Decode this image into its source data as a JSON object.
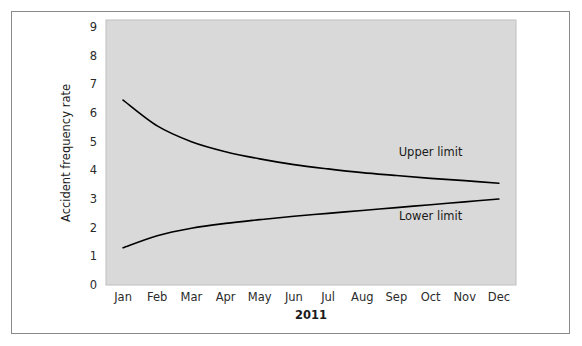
{
  "figure": {
    "width": 582,
    "height": 346,
    "background_color": "#ffffff",
    "border_color": "#8a8a8a",
    "plot_background_color": "#d9d9d9",
    "curve_color": "#000000"
  },
  "chart_data": {
    "type": "line",
    "title": "",
    "subtitle": "",
    "xlabel": "2011",
    "ylabel": "Accident frequency rate",
    "categories": [
      "Jan",
      "Feb",
      "Mar",
      "Apr",
      "May",
      "Jun",
      "Jul",
      "Aug",
      "Sep",
      "Oct",
      "Nov",
      "Dec"
    ],
    "xtick_labels": [
      "Jan",
      "Feb",
      "Mar",
      "Apr",
      "May",
      "Jun",
      "Jul",
      "Aug",
      "Sep",
      "Oct",
      "Nov",
      "Dec"
    ],
    "ytick_labels": [
      "0",
      "1",
      "2",
      "3",
      "4",
      "5",
      "6",
      "7",
      "8",
      "9"
    ],
    "yticks": [
      0,
      1,
      2,
      3,
      4,
      5,
      6,
      7,
      8,
      9
    ],
    "ylim": [
      0,
      9.3
    ],
    "grid": false,
    "legend": "none",
    "series": [
      {
        "name": "Upper limit",
        "values": [
          6.45,
          5.55,
          5.0,
          4.65,
          4.4,
          4.2,
          4.05,
          3.92,
          3.82,
          3.72,
          3.64,
          3.55
        ]
      },
      {
        "name": "Lower limit",
        "values": [
          1.3,
          1.72,
          1.98,
          2.15,
          2.28,
          2.4,
          2.5,
          2.6,
          2.7,
          2.8,
          2.9,
          3.0
        ]
      }
    ],
    "annotations": [
      {
        "text": "Upper limit",
        "series": "Upper limit",
        "x_category": "Oct",
        "y_value": 4.65
      },
      {
        "text": "Lower limit",
        "series": "Lower limit",
        "x_category": "Oct",
        "y_value": 2.4
      }
    ]
  }
}
